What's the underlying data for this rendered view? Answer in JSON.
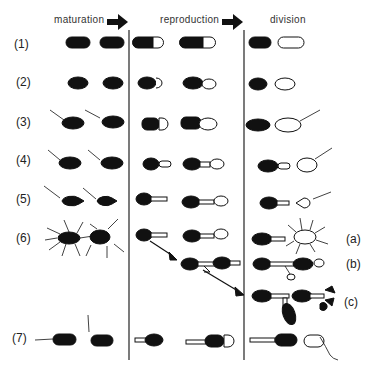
{
  "headers": {
    "maturation": "maturation",
    "reproduction": "reproduction",
    "division": "division"
  },
  "rows": [
    {
      "label": "(1)"
    },
    {
      "label": "(2)"
    },
    {
      "label": "(3)"
    },
    {
      "label": "(4)"
    },
    {
      "label": "(5)"
    },
    {
      "label": "(6)"
    },
    {
      "label": "(7)"
    }
  ],
  "variants": {
    "a": "(a)",
    "b": "(b)",
    "c": "(c)"
  },
  "colors": {
    "cell_fill": "#111111",
    "outline": "#222222",
    "divider": "#333333"
  }
}
